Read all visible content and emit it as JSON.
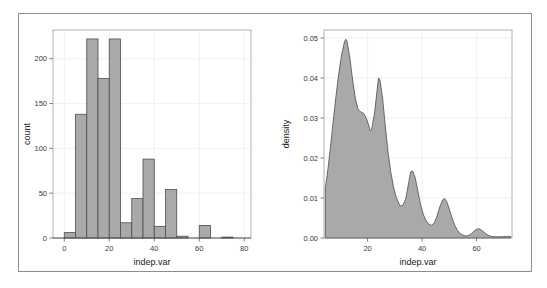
{
  "figure": {
    "background_color": "#ffffff",
    "frame_color": "#8d8d8d",
    "fill_color": "#a9a9a9",
    "outline_color": "#4d4d4d",
    "grid_color": "#ececec"
  },
  "chart_data": [
    {
      "type": "bar",
      "name": "histogram-panel",
      "title": "",
      "xlabel": "indep.var",
      "ylabel": "count",
      "xlim": [
        -5,
        83
      ],
      "ylim": [
        0,
        232
      ],
      "xticks": [
        0,
        20,
        40,
        60,
        80
      ],
      "xtick_labels": [
        "0",
        "20",
        "40",
        "60",
        "80"
      ],
      "yticks": [
        0,
        50,
        100,
        150,
        200
      ],
      "ytick_labels": [
        "0",
        "50",
        "100",
        "150",
        "200"
      ],
      "grid": true,
      "legend": "none",
      "bin_width": 5,
      "bin_starts": [
        0,
        5,
        10,
        15,
        20,
        25,
        30,
        35,
        40,
        45,
        50,
        55,
        60,
        65,
        70
      ],
      "categories": [
        "0-5",
        "5-10",
        "10-15",
        "15-20",
        "20-25",
        "25-30",
        "30-35",
        "35-40",
        "40-45",
        "45-50",
        "50-55",
        "55-60",
        "60-65",
        "65-70",
        "70-75"
      ],
      "values": [
        6,
        138,
        222,
        178,
        222,
        17,
        44,
        88,
        13,
        54,
        2,
        0,
        14,
        0,
        1
      ]
    },
    {
      "type": "area",
      "name": "density-panel",
      "title": "",
      "xlabel": "indep.var",
      "ylabel": "density",
      "xlim": [
        4,
        73
      ],
      "ylim": [
        0,
        0.052
      ],
      "xticks": [
        20,
        40,
        60
      ],
      "xtick_labels": [
        "20",
        "40",
        "60"
      ],
      "yticks": [
        0.0,
        0.01,
        0.02,
        0.03,
        0.04,
        0.05
      ],
      "ytick_labels": [
        "0.00",
        "0.01",
        "0.02",
        "0.03",
        "0.04",
        "0.05"
      ],
      "grid": true,
      "legend": "none",
      "x": [
        4.5,
        5.5,
        6.5,
        7.5,
        8.5,
        9.5,
        10.5,
        11.5,
        12.0,
        12.5,
        13.5,
        14.5,
        15.5,
        16.5,
        17.5,
        18.5,
        19.5,
        20.5,
        21.0,
        21.5,
        22.5,
        23.5,
        24.0,
        24.5,
        25.5,
        26.5,
        27.5,
        28.5,
        29.5,
        30.5,
        31.5,
        32.0,
        33.0,
        34.0,
        35.0,
        35.8,
        36.5,
        37.5,
        38.5,
        39.5,
        40.5,
        41.5,
        42.5,
        43.5,
        44.5,
        45.5,
        46.5,
        47.5,
        48.2,
        49.0,
        50.0,
        51.0,
        52.0,
        53.0,
        54.0,
        55.0,
        56.0,
        57.0,
        58.0,
        59.0,
        60.0,
        60.8,
        61.5,
        62.5,
        63.5,
        64.5,
        65.5,
        67.0,
        69.0,
        71.0,
        72.5
      ],
      "y": [
        0.0125,
        0.0175,
        0.0235,
        0.03,
        0.036,
        0.0415,
        0.046,
        0.049,
        0.0497,
        0.049,
        0.045,
        0.0395,
        0.035,
        0.0322,
        0.0315,
        0.0312,
        0.03,
        0.028,
        0.0268,
        0.0272,
        0.031,
        0.037,
        0.04,
        0.0396,
        0.035,
        0.028,
        0.0215,
        0.0165,
        0.0128,
        0.0102,
        0.0086,
        0.008,
        0.0082,
        0.0098,
        0.0135,
        0.0165,
        0.0168,
        0.015,
        0.0115,
        0.0082,
        0.0058,
        0.0043,
        0.0034,
        0.0032,
        0.0038,
        0.0055,
        0.0078,
        0.0095,
        0.0099,
        0.0092,
        0.0072,
        0.005,
        0.0032,
        0.0019,
        0.0011,
        0.0007,
        0.0005,
        0.0006,
        0.001,
        0.0017,
        0.0022,
        0.0023,
        0.0021,
        0.0016,
        0.001,
        0.0006,
        0.0004,
        0.0003,
        0.0003,
        0.0004,
        0.0004
      ]
    }
  ]
}
